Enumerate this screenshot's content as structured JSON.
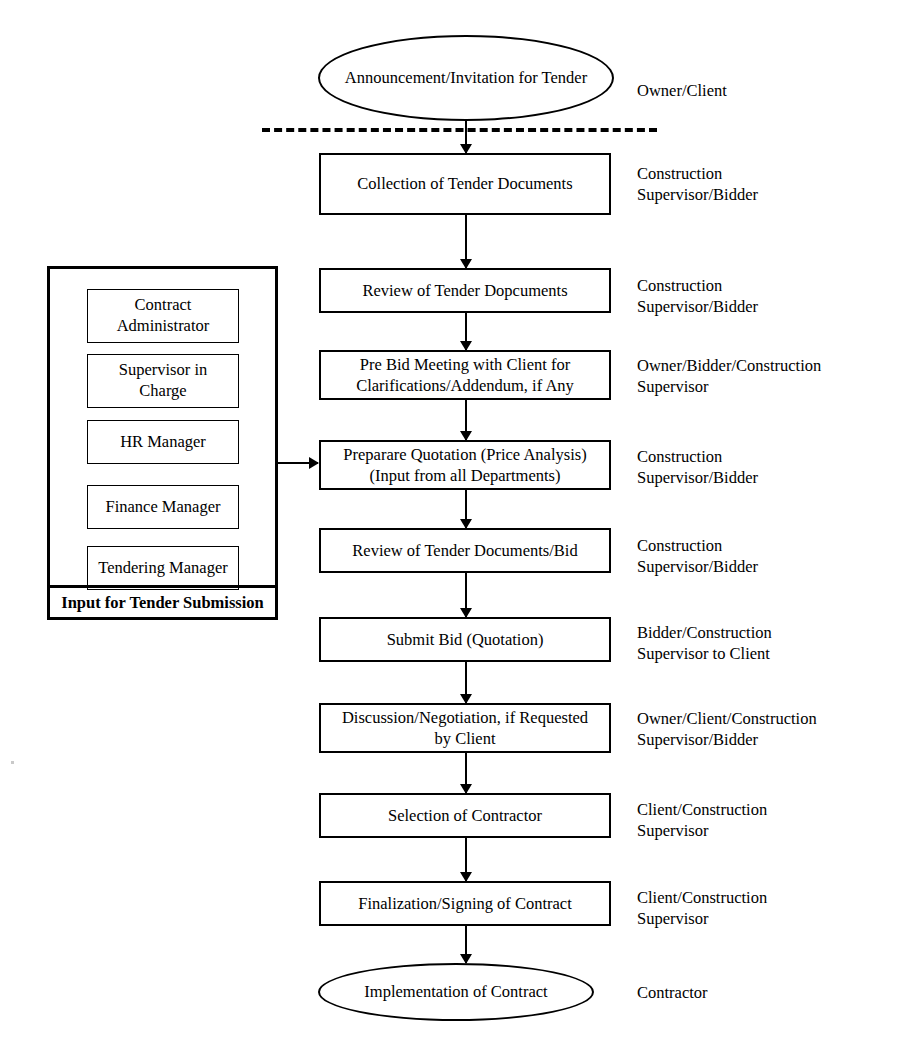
{
  "diagram": {
    "nodes": [
      {
        "id": "announcement",
        "type": "terminator",
        "lines": [
          "Announcement/Invitation",
          "for Tender"
        ],
        "role": [
          "Owner/Client"
        ]
      },
      {
        "id": "collection",
        "type": "process",
        "lines": [
          "Collection of Tender Documents"
        ],
        "role": [
          "Construction",
          "Supervisor/Bidder"
        ]
      },
      {
        "id": "review-docs",
        "type": "process",
        "lines": [
          "Review of Tender Dopcuments"
        ],
        "role": [
          "Construction",
          "Supervisor/Bidder"
        ]
      },
      {
        "id": "pre-bid-meeting",
        "type": "process",
        "lines": [
          "Pre Bid Meeting with Client for",
          "Clarifications/Addendum, if Any"
        ],
        "role": [
          "Owner/Bidder/Construction",
          "Supervisor"
        ]
      },
      {
        "id": "prepare-quotation",
        "type": "process",
        "lines": [
          "Preparare Quotation (Price Analysis)",
          "(Input from all Departments)"
        ],
        "role": [
          "Construction",
          "Supervisor/Bidder"
        ]
      },
      {
        "id": "review-bid",
        "type": "process",
        "lines": [
          "Review of Tender Documents/Bid"
        ],
        "role": [
          "Construction",
          "Supervisor/Bidder"
        ]
      },
      {
        "id": "submit-bid",
        "type": "process",
        "lines": [
          "Submit Bid (Quotation)"
        ],
        "role": [
          "Bidder/Construction",
          "Supervisor to Client"
        ]
      },
      {
        "id": "negotiation",
        "type": "process",
        "lines": [
          "Discussion/Negotiation, if Requested",
          "by Client"
        ],
        "role": [
          "Owner/Client/Construction",
          "Supervisor/Bidder"
        ]
      },
      {
        "id": "selection",
        "type": "process",
        "lines": [
          "Selection of Contractor"
        ],
        "role": [
          "Client/Construction",
          "Supervisor"
        ]
      },
      {
        "id": "finalization",
        "type": "process",
        "lines": [
          "Finalization/Signing of Contract"
        ],
        "role": [
          "Client/Construction",
          "Supervisor"
        ]
      },
      {
        "id": "implementation",
        "type": "terminator",
        "lines": [
          "Implementation of Contract"
        ],
        "role": [
          "Contractor"
        ]
      }
    ]
  },
  "input_panel": {
    "footer_label": "Input for Tender Submission",
    "items": [
      {
        "id": "contract-administrator",
        "lines": [
          "Contract",
          "Administrator"
        ]
      },
      {
        "id": "supervisor-in-charge",
        "lines": [
          "Supervisor in",
          "Charge"
        ]
      },
      {
        "id": "hr-manager",
        "lines": [
          "HR Manager"
        ]
      },
      {
        "id": "finance-manager",
        "lines": [
          "Finance Manager"
        ]
      },
      {
        "id": "tendering-manager",
        "lines": [
          "Tendering Manager"
        ]
      }
    ]
  },
  "style": {
    "line_color": "#000000",
    "background": "#ffffff"
  }
}
